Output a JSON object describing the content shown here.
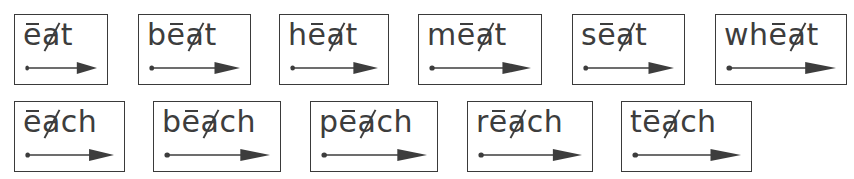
{
  "header": {
    "cutoff_text": ""
  },
  "marks": {
    "long_vowel": "e (macron)",
    "silent_vowel": "a (crossed out)"
  },
  "colors": {
    "ink": "#3d3d3d",
    "border": "#3a3a3a",
    "background": "#ffffff"
  },
  "rows": [
    {
      "words": [
        {
          "word": "eat",
          "pre": "",
          "long": "e",
          "silent": "a",
          "post": "t",
          "box": [
            14,
            14,
            94,
            71
          ]
        },
        {
          "word": "beat",
          "pre": "b",
          "long": "e",
          "silent": "a",
          "post": "t",
          "box": [
            138,
            14,
            113,
            71
          ]
        },
        {
          "word": "heat",
          "pre": "h",
          "long": "e",
          "silent": "a",
          "post": "t",
          "box": [
            279,
            14,
            110,
            71
          ]
        },
        {
          "word": "meat",
          "pre": "m",
          "long": "e",
          "silent": "a",
          "post": "t",
          "box": [
            418,
            14,
            124,
            71
          ]
        },
        {
          "word": "seat",
          "pre": "s",
          "long": "e",
          "silent": "a",
          "post": "t",
          "box": [
            572,
            14,
            113,
            71
          ]
        },
        {
          "word": "wheat",
          "pre": "wh",
          "long": "e",
          "silent": "a",
          "post": "t",
          "box": [
            715,
            14,
            132,
            71
          ]
        }
      ]
    },
    {
      "words": [
        {
          "word": "each",
          "pre": "",
          "long": "e",
          "silent": "a",
          "post": "ch",
          "box": [
            14,
            101,
            111,
            71
          ]
        },
        {
          "word": "beach",
          "pre": "b",
          "long": "e",
          "silent": "a",
          "post": "ch",
          "box": [
            153,
            101,
            128,
            71
          ]
        },
        {
          "word": "peach",
          "pre": "p",
          "long": "e",
          "silent": "a",
          "post": "ch",
          "box": [
            310,
            101,
            128,
            71
          ]
        },
        {
          "word": "reach",
          "pre": "r",
          "long": "e",
          "silent": "a",
          "post": "ch",
          "box": [
            467,
            101,
            126,
            71
          ]
        },
        {
          "word": "teach",
          "pre": "t",
          "long": "e",
          "silent": "a",
          "post": "ch",
          "box": [
            621,
            101,
            131,
            71
          ]
        }
      ]
    }
  ],
  "arrow_icon": "dot-to-arrow (read left to right)"
}
